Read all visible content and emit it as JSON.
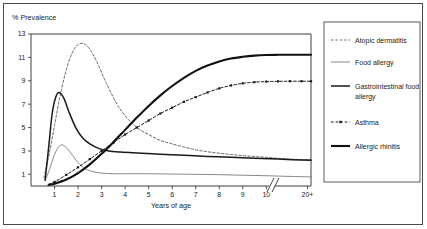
{
  "figure": {
    "ylabel": "% Prevalence",
    "xlabel": "Years of age",
    "axis_break_note": "20+"
  },
  "chart_data": {
    "type": "line",
    "title": "",
    "xlabel": "Years of age",
    "ylabel": "% Prevalence",
    "xlim": [
      0,
      11.9
    ],
    "ylim": [
      0,
      13
    ],
    "grid": false,
    "legend_position": "right",
    "xticks": [
      1,
      2,
      3,
      4,
      5,
      6,
      7,
      8,
      9,
      10,
      20
    ],
    "xtick_labels": [
      "1",
      "2",
      "3",
      "4",
      "5",
      "6",
      "7",
      "8",
      "9",
      "10",
      "20+"
    ],
    "yticks": [
      1,
      3,
      5,
      7,
      9,
      11,
      13
    ],
    "ytick_labels": [
      "1",
      "3",
      "5",
      "7",
      "9",
      "11",
      "13"
    ],
    "axis_break_after_x": 10.6,
    "series": [
      {
        "name": "Atopic dermatitis",
        "style": "dashed",
        "color": "#555555",
        "width": 0.9,
        "x": [
          0.55,
          0.8,
          1.0,
          1.3,
          1.6,
          1.9,
          2.2,
          2.5,
          2.8,
          3.2,
          3.6,
          4.0,
          4.5,
          5.0,
          5.5,
          6.0,
          7.0,
          8.0,
          9.0,
          10.0,
          11.0,
          11.9
        ],
        "values": [
          0.7,
          3.0,
          5.2,
          8.3,
          10.6,
          11.9,
          12.2,
          11.7,
          10.6,
          8.8,
          7.2,
          6.0,
          5.0,
          4.4,
          3.9,
          3.6,
          3.1,
          2.8,
          2.6,
          2.45,
          2.3,
          2.25
        ]
      },
      {
        "name": "Food allergy",
        "style": "solid-thin",
        "color": "#6b6b6b",
        "width": 0.8,
        "x": [
          0.6,
          0.8,
          1.0,
          1.2,
          1.35,
          1.5,
          1.7,
          2.0,
          2.3,
          2.6,
          3.0,
          3.5,
          4.0,
          5.0,
          6.0,
          7.0,
          8.0,
          9.0,
          10.0,
          11.0,
          11.9
        ],
        "values": [
          0.45,
          1.5,
          2.7,
          3.4,
          3.5,
          3.3,
          2.8,
          2.0,
          1.5,
          1.25,
          1.1,
          1.05,
          1.05,
          1.05,
          1.02,
          1.0,
          0.97,
          0.92,
          0.88,
          0.82,
          0.78
        ]
      },
      {
        "name": "Gastrointestinal food allergy",
        "style": "solid-medium",
        "color": "#1a1a1a",
        "width": 1.5,
        "x": [
          0.6,
          0.75,
          0.9,
          1.05,
          1.2,
          1.4,
          1.6,
          1.9,
          2.2,
          2.5,
          2.9,
          3.3,
          3.8,
          4.5,
          5.5,
          6.5,
          7.5,
          8.5,
          9.5,
          10.5,
          11.9
        ],
        "values": [
          0.5,
          3.3,
          6.2,
          7.6,
          8.0,
          7.5,
          6.4,
          5.0,
          4.1,
          3.6,
          3.2,
          3.0,
          2.9,
          2.82,
          2.72,
          2.62,
          2.53,
          2.45,
          2.38,
          2.3,
          2.2
        ]
      },
      {
        "name": "Asthma",
        "style": "dash-dot-marker",
        "color": "#1a1a1a",
        "width": 1.0,
        "x": [
          0.75,
          1.0,
          1.5,
          2.0,
          2.5,
          3.0,
          3.5,
          4.0,
          4.5,
          5.0,
          5.5,
          6.0,
          6.5,
          7.0,
          7.5,
          8.0,
          8.5,
          9.0,
          9.5,
          10.0,
          10.5,
          11.0,
          11.5,
          11.9
        ],
        "values": [
          0.15,
          0.35,
          0.95,
          1.6,
          2.3,
          3.0,
          3.7,
          4.4,
          5.0,
          5.6,
          6.2,
          6.7,
          7.2,
          7.6,
          8.0,
          8.35,
          8.6,
          8.78,
          8.88,
          8.93,
          8.95,
          8.96,
          8.96,
          8.96
        ]
      },
      {
        "name": "Allergic rhinitis",
        "style": "solid-thick",
        "color": "#111111",
        "width": 2.1,
        "x": [
          0.75,
          1.0,
          1.5,
          2.0,
          2.5,
          3.0,
          3.5,
          4.0,
          4.5,
          5.0,
          5.5,
          6.0,
          6.5,
          7.0,
          7.5,
          8.0,
          8.5,
          9.0,
          9.5,
          10.0,
          10.5,
          11.0,
          11.5,
          11.9
        ],
        "values": [
          0.1,
          0.2,
          0.55,
          1.1,
          1.85,
          2.75,
          3.75,
          4.8,
          5.85,
          6.85,
          7.75,
          8.55,
          9.25,
          9.85,
          10.3,
          10.65,
          10.9,
          11.05,
          11.15,
          11.2,
          11.22,
          11.23,
          11.23,
          11.23
        ]
      }
    ]
  },
  "legend": {
    "items": [
      {
        "label": "Atopic dermatitis",
        "style": "dashed"
      },
      {
        "label": "Food allergy",
        "style": "solid-thin"
      },
      {
        "label": "Gastrointestinal food",
        "label2": "allergy",
        "style": "solid-medium"
      },
      {
        "label": "Asthma",
        "style": "dash-dot-marker"
      },
      {
        "label": "Allergic rhinitis",
        "style": "solid-thick"
      }
    ]
  }
}
